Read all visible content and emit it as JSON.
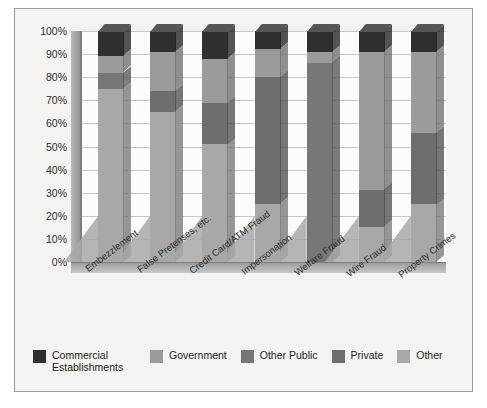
{
  "chart_data": {
    "type": "bar",
    "subtype": "stacked-100-percent-3d",
    "title": "",
    "xlabel": "",
    "ylabel": "",
    "ylim": [
      0,
      100
    ],
    "grid": true,
    "legend_position": "bottom",
    "ytick_labels": [
      "100%",
      "90%",
      "80%",
      "70%",
      "60%",
      "50%",
      "40%",
      "30%",
      "20%",
      "10%",
      "0%"
    ],
    "ytick_values": [
      100,
      90,
      80,
      70,
      60,
      50,
      40,
      30,
      20,
      10,
      0
    ],
    "categories": [
      "Embezzlement",
      "False Pretenses, etc.",
      "Credit Card/ATM Fraud",
      "Impersonation",
      "Welfare Fraud",
      "Wire Fraud",
      "Property Crimes"
    ],
    "series": [
      {
        "name": "Other",
        "color": "#a8a8a8",
        "values": [
          75,
          65,
          51,
          25,
          0,
          15,
          25
        ]
      },
      {
        "name": "Private",
        "color": "#6e6e6e",
        "values": [
          0,
          9,
          18,
          55,
          0,
          16,
          31
        ]
      },
      {
        "name": "Other Public",
        "color": "#777777",
        "values": [
          7,
          0,
          0,
          0,
          86,
          0,
          0
        ]
      },
      {
        "name": "Government",
        "color": "#9b9b9b",
        "values": [
          7,
          17,
          19,
          12,
          5,
          60,
          35
        ]
      },
      {
        "name": "Commercial Establishments",
        "color": "#2f2f2f",
        "values": [
          11,
          9,
          12,
          8,
          9,
          9,
          9
        ]
      }
    ]
  },
  "legend": {
    "items": [
      {
        "label": "Commercial Establishments",
        "color": "#2f2f2f"
      },
      {
        "label": "Government",
        "color": "#9b9b9b"
      },
      {
        "label": "Other Public",
        "color": "#777777"
      },
      {
        "label": "Private",
        "color": "#6e6e6e"
      },
      {
        "label": "Other",
        "color": "#a8a8a8"
      }
    ]
  }
}
